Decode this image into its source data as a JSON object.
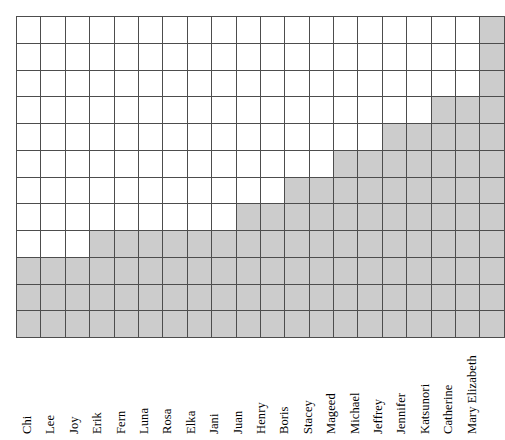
{
  "chart_data": {
    "type": "bar",
    "title": "",
    "subtitle": "",
    "xlabel": "",
    "ylabel": "",
    "grid": true,
    "legend": "none",
    "orientation": "vertical",
    "style": "grid-block-bar",
    "rows": 12,
    "columns": 20,
    "ylim": [
      0,
      12
    ],
    "yticks": [
      0,
      1,
      2,
      3,
      4,
      5,
      6,
      7,
      8,
      9,
      10,
      11,
      12
    ],
    "ytick_labels": [],
    "categories": [
      "Chi",
      "Lee",
      "Joy",
      "Erik",
      "Fern",
      "Luna",
      "Rosa",
      "Elka",
      "Jani",
      "Juan",
      "Henry",
      "Boris",
      "Stacey",
      "Mageed",
      "Michael",
      "Jeffrey",
      "Jennifer",
      "Katsunori",
      "Catherine",
      "Mary Elizabeth"
    ],
    "values": [
      3,
      3,
      3,
      4,
      4,
      4,
      4,
      4,
      4,
      5,
      5,
      6,
      6,
      7,
      7,
      8,
      8,
      9,
      9,
      12
    ],
    "colors": {
      "fill": "#cccccc",
      "gridline": "#4d4d4d",
      "background": "#ffffff",
      "text": "#000000"
    }
  }
}
